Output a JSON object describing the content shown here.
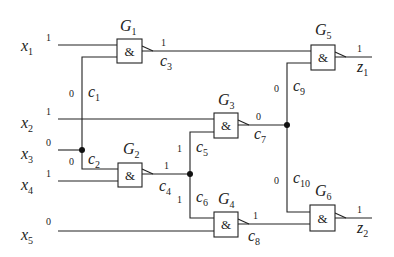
{
  "diagram": {
    "type": "logic-circuit",
    "inputs": [
      {
        "name": "x",
        "sub": "1",
        "value": "1"
      },
      {
        "name": "x",
        "sub": "2",
        "value": "1"
      },
      {
        "name": "x",
        "sub": "3",
        "value": "0"
      },
      {
        "name": "x",
        "sub": "4",
        "value": "1"
      },
      {
        "name": "x",
        "sub": "5",
        "value": "0"
      }
    ],
    "gates": [
      {
        "name": "G",
        "sub": "1",
        "symbol": "&"
      },
      {
        "name": "G",
        "sub": "2",
        "symbol": "&"
      },
      {
        "name": "G",
        "sub": "3",
        "symbol": "&"
      },
      {
        "name": "G",
        "sub": "4",
        "symbol": "&"
      },
      {
        "name": "G",
        "sub": "5",
        "symbol": "&"
      },
      {
        "name": "G",
        "sub": "6",
        "symbol": "&"
      }
    ],
    "connections": [
      {
        "name": "c",
        "sub": "1",
        "value": "0"
      },
      {
        "name": "c",
        "sub": "2",
        "value": "0"
      },
      {
        "name": "c",
        "sub": "3",
        "value": "1"
      },
      {
        "name": "c",
        "sub": "4",
        "value": "1"
      },
      {
        "name": "c",
        "sub": "5",
        "value": "1"
      },
      {
        "name": "c",
        "sub": "6",
        "value": "1"
      },
      {
        "name": "c",
        "sub": "7",
        "value": "0"
      },
      {
        "name": "c",
        "sub": "8",
        "value": "1"
      },
      {
        "name": "c",
        "sub": "9",
        "value": "0"
      },
      {
        "name": "c",
        "sub": "10",
        "value": "0"
      }
    ],
    "outputs": [
      {
        "name": "z",
        "sub": "1",
        "value": "1"
      },
      {
        "name": "z",
        "sub": "2",
        "value": "1"
      }
    ]
  }
}
